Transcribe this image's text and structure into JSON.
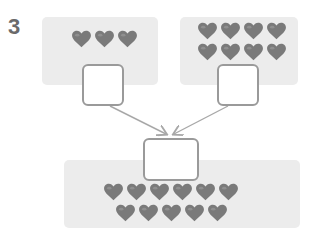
{
  "problem_number": "3",
  "groups": [
    {
      "name": "left-group",
      "count": 3,
      "answer_box": ""
    },
    {
      "name": "right-group",
      "count": 8,
      "answer_box": ""
    },
    {
      "name": "total-group",
      "count": 11,
      "answer_box": ""
    }
  ],
  "colors": {
    "heart": "#7a7a7a",
    "panel": "#ececec",
    "box_border": "#9a9a9a",
    "arrow": "#a8a8a8"
  }
}
